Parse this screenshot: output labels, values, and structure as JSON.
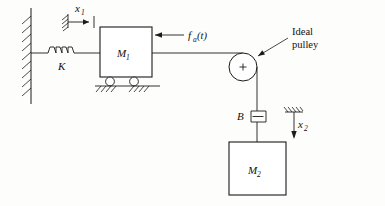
{
  "figure": {
    "type": "mechanical-system-schematic",
    "title": ""
  },
  "labels": {
    "spring": "K",
    "mass1": "M",
    "mass1_sub": "1",
    "mass2": "M",
    "mass2_sub": "2",
    "damper": "B",
    "force": "f",
    "force_sub": "a",
    "force_arg": "(t)",
    "disp1": "x",
    "disp1_sub": "1",
    "disp2": "x",
    "disp2_sub": "2",
    "pulley_line1": "Ideal",
    "pulley_line2": "pulley",
    "pulley_center_mark": "+"
  },
  "colors": {
    "ink": "#1b1b1b",
    "paper": "#fdfdfc",
    "fill": "#ffffff"
  },
  "components": [
    {
      "name": "wall",
      "kind": "fixed-support",
      "orientation": "vertical"
    },
    {
      "name": "spring",
      "kind": "spring",
      "label": "K",
      "coils": 4
    },
    {
      "name": "mass1",
      "kind": "mass-block",
      "label": "M1"
    },
    {
      "name": "rollers",
      "kind": "roller-supports",
      "count": 2
    },
    {
      "name": "ground",
      "kind": "ground-hatch"
    },
    {
      "name": "force",
      "kind": "applied-force",
      "label": "fa(t)",
      "direction": "left"
    },
    {
      "name": "pulley",
      "kind": "ideal-pulley"
    },
    {
      "name": "damper",
      "kind": "dashpot",
      "label": "B"
    },
    {
      "name": "mass2",
      "kind": "mass-block",
      "label": "M2"
    },
    {
      "name": "disp1",
      "kind": "displacement-reference",
      "label": "x1",
      "direction": "right"
    },
    {
      "name": "disp2",
      "kind": "displacement-reference",
      "label": "x2",
      "direction": "down"
    }
  ]
}
